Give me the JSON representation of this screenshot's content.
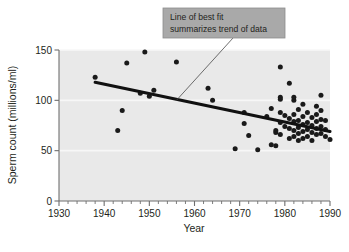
{
  "figure": {
    "background": "#ffffff",
    "plot_background": "#e9e9e9",
    "gridline_color": "#f7f7f7",
    "axis_color": "#6f6f6f",
    "point_color": "#1a1a1a",
    "trendline_color": "#111111",
    "callout_background": "#a9a9a9",
    "callout_border": "#8d8d8d"
  },
  "callout": {
    "line1": "Line of best fit",
    "line2": "summarizes trend of data"
  },
  "chart_data": {
    "type": "scatter",
    "title": "",
    "xlabel": "Year",
    "ylabel": "Sperm count (millions/ml)",
    "xlim": [
      1930,
      1990
    ],
    "ylim": [
      0,
      150
    ],
    "xticks": [
      1930,
      1940,
      1950,
      1960,
      1970,
      1980,
      1990
    ],
    "xtick_labels": [
      "1930",
      "1940",
      "1950",
      "1960",
      "1970",
      "1980",
      "1990"
    ],
    "x_minor_tick_step": 2,
    "yticks": [
      0,
      50,
      100,
      150
    ],
    "ytick_labels": [
      "0",
      "50",
      "100",
      "150"
    ],
    "grid": "horizontal-white-at-50-100-150",
    "legend": "none",
    "annotations": [
      {
        "text": "Line of best fit summarizes trend of data",
        "points_to_x": 1956,
        "points_to_y": 100
      }
    ],
    "series": [
      {
        "name": "Sperm count studies",
        "marker": "filled-circle",
        "points": [
          [
            1938,
            123
          ],
          [
            1943,
            70
          ],
          [
            1944,
            90
          ],
          [
            1945,
            137
          ],
          [
            1948,
            107
          ],
          [
            1949,
            148
          ],
          [
            1950,
            104
          ],
          [
            1951,
            110
          ],
          [
            1956,
            138
          ],
          [
            1963,
            112
          ],
          [
            1964,
            100
          ],
          [
            1969,
            52
          ],
          [
            1971,
            77
          ],
          [
            1971,
            88
          ],
          [
            1972,
            65
          ],
          [
            1974,
            51
          ],
          [
            1976,
            84
          ],
          [
            1977,
            56
          ],
          [
            1977,
            92
          ],
          [
            1978,
            55
          ],
          [
            1978,
            68
          ],
          [
            1978,
            70
          ],
          [
            1979,
            133
          ],
          [
            1979,
            101
          ],
          [
            1979,
            103
          ],
          [
            1979,
            88
          ],
          [
            1979,
            78
          ],
          [
            1979,
            66
          ],
          [
            1980,
            74
          ],
          [
            1980,
            85
          ],
          [
            1981,
            117
          ],
          [
            1981,
            82
          ],
          [
            1981,
            72
          ],
          [
            1981,
            62
          ],
          [
            1982,
            100
          ],
          [
            1982,
            103
          ],
          [
            1982,
            86
          ],
          [
            1982,
            79
          ],
          [
            1982,
            70
          ],
          [
            1982,
            64
          ],
          [
            1983,
            91
          ],
          [
            1983,
            80
          ],
          [
            1983,
            73
          ],
          [
            1983,
            67
          ],
          [
            1983,
            60
          ],
          [
            1984,
            96
          ],
          [
            1984,
            84
          ],
          [
            1984,
            76
          ],
          [
            1984,
            69
          ],
          [
            1984,
            62
          ],
          [
            1985,
            88
          ],
          [
            1985,
            78
          ],
          [
            1985,
            71
          ],
          [
            1985,
            64
          ],
          [
            1986,
            83
          ],
          [
            1986,
            75
          ],
          [
            1986,
            68
          ],
          [
            1986,
            60
          ],
          [
            1987,
            94
          ],
          [
            1987,
            86
          ],
          [
            1987,
            79
          ],
          [
            1987,
            72
          ],
          [
            1987,
            66
          ],
          [
            1988,
            105
          ],
          [
            1988,
            90
          ],
          [
            1988,
            81
          ],
          [
            1988,
            74
          ],
          [
            1988,
            67
          ],
          [
            1989,
            80
          ],
          [
            1989,
            71
          ],
          [
            1989,
            64
          ],
          [
            1990,
            61
          ]
        ]
      }
    ],
    "trendline": {
      "name": "Line of best fit",
      "x_start": 1938,
      "y_start": 118,
      "x_end": 1990,
      "y_end": 69
    }
  }
}
